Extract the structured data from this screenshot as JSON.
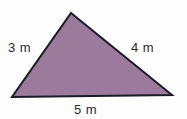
{
  "figure": {
    "type": "triangle-diagram",
    "background_color": "#fdfdfd",
    "shape": {
      "name": "triangle",
      "fill_color": "#9c7a9c",
      "stroke_color": "#1a1a28",
      "stroke_width": 2,
      "vertices": [
        {
          "name": "apex",
          "x": 71,
          "y": 13
        },
        {
          "name": "bottom-right",
          "x": 172,
          "y": 95
        },
        {
          "name": "bottom-left",
          "x": 12,
          "y": 97
        }
      ]
    },
    "labels": {
      "left": {
        "text": "3 m",
        "value": 3,
        "unit": "m",
        "side": "left"
      },
      "right": {
        "text": "4 m",
        "value": 4,
        "unit": "m",
        "side": "right"
      },
      "bottom": {
        "text": "5 m",
        "value": 5,
        "unit": "m",
        "side": "bottom"
      }
    }
  }
}
